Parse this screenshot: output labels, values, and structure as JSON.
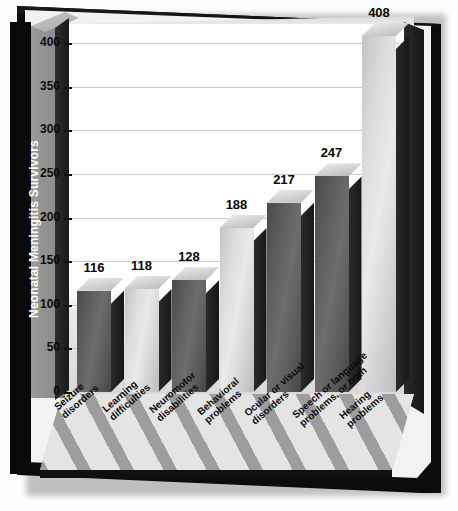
{
  "chart_data": {
    "type": "bar",
    "title": "",
    "xlabel": "",
    "ylabel": "Neonatal Meningitis Survivors",
    "ylim": [
      0,
      400
    ],
    "yticks": [
      0,
      50,
      100,
      150,
      200,
      250,
      300,
      350,
      400
    ],
    "grid": true,
    "legend": "none",
    "style": "3d-bar-chart",
    "categories": [
      "Seizure\ndisorders",
      "Learning\ndifficulties",
      "Neuromotor\ndisabilities",
      "Behavioral\nproblems",
      "Ocular or visual\ndisorders",
      "Speech or language\nproblems, or both",
      "Hearing\nproblems"
    ],
    "values": [
      116,
      118,
      128,
      188,
      217,
      247,
      408
    ],
    "value_labels": [
      "116",
      "118",
      "128",
      "188",
      "217",
      "247",
      "408"
    ],
    "bar_shades": [
      "dark",
      "light",
      "dark",
      "light",
      "dark",
      "dark",
      "light"
    ],
    "colors": {
      "bar_dark": "#5e5e5e",
      "bar_light": "#dcdcdc",
      "bar_side": "#1f1f1f",
      "bar_top": "#d4d4d4",
      "frame": "#0c0c0c",
      "plot_background": "#ffffff",
      "gridline": "#c9c9c9",
      "axis_label_panel": "#0a0a0a",
      "axis_label_text": "#ffffff",
      "floor_light": "#e4e4e4",
      "floor_dark": "#9d9d9d",
      "value_text": "#070707"
    }
  }
}
